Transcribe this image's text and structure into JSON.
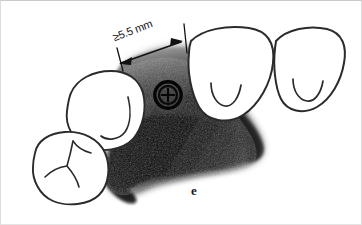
{
  "figure": {
    "type": "hand-drawn-dental-diagram",
    "panel_letter": "e",
    "dimension": {
      "label": "≥5.5 mm",
      "value": 5.5,
      "operator": "≥",
      "unit": "mm",
      "arrow_style": "double-headed",
      "meaning": "minimum mesio-distal edentulous space width"
    },
    "implant": {
      "name": "implant-cross-section-symbol",
      "rings": 2,
      "inner_pattern": "cross-quadrants"
    },
    "teeth": [
      {
        "name": "tooth-left-upper",
        "cusp_pattern": "hook-groove"
      },
      {
        "name": "tooth-left-lower",
        "cusp_pattern": "y-shaped-fissure"
      },
      {
        "name": "tooth-right-inner",
        "cusp_pattern": "u-shaped-groove"
      },
      {
        "name": "tooth-right-outer",
        "cusp_pattern": "u-shaped-groove"
      }
    ],
    "ridge": {
      "name": "edentulous-ridge-shading",
      "style": "dark-pencil-shading"
    },
    "colors": {
      "background": "#ffffff",
      "ink": "#1d1d1d",
      "outline": "#333333",
      "shading_dark": "#0c0c0c",
      "shading_mid": "#4a4a4a",
      "shading_light": "#8c8c8c",
      "frame_border": "#d2d2d2"
    }
  }
}
